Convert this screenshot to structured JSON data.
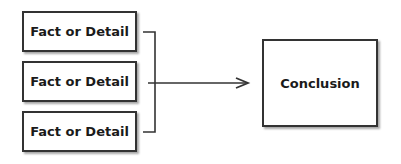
{
  "diagram": {
    "facts": [
      {
        "label": "Fact or Detail"
      },
      {
        "label": "Fact or Detail"
      },
      {
        "label": "Fact or Detail"
      }
    ],
    "conclusion": {
      "label": "Conclusion"
    },
    "colors": {
      "stroke": "#333333",
      "text": "#1a1a1a",
      "background": "#ffffff"
    }
  }
}
